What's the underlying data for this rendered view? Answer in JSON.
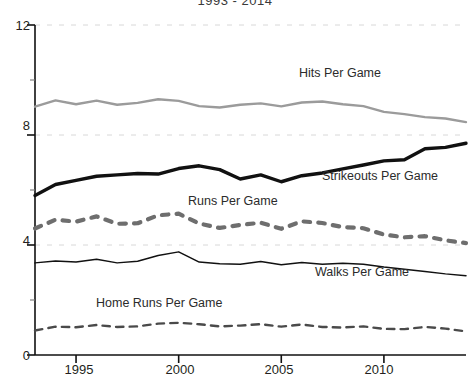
{
  "chart_data": {
    "type": "line",
    "title": "1993 - 2014",
    "xlabel": "",
    "ylabel": "",
    "xlim": [
      1993,
      2014
    ],
    "ylim": [
      0,
      12
    ],
    "yticks": [
      0,
      4,
      8,
      12
    ],
    "yticks_minor": [
      2,
      6,
      10
    ],
    "xticks": [
      1995,
      2000,
      2005,
      2010
    ],
    "xticks_minor": [
      1993,
      1994,
      1996,
      1997,
      1998,
      1999,
      2001,
      2002,
      2003,
      2004,
      2006,
      2007,
      2008,
      2009,
      2011,
      2012,
      2013,
      2014
    ],
    "grid": "horizontal-dotted-faint",
    "legend": "inline-annotations",
    "x": [
      1993,
      1994,
      1995,
      1996,
      1997,
      1998,
      1999,
      2000,
      2001,
      2002,
      2003,
      2004,
      2005,
      2006,
      2007,
      2008,
      2009,
      2010,
      2011,
      2012,
      2013,
      2014
    ],
    "series": [
      {
        "name": "Hits Per Game",
        "color": "#9b9b9b",
        "style": "solid",
        "width": 2.4,
        "values": [
          9.03,
          9.26,
          9.12,
          9.25,
          9.1,
          9.17,
          9.3,
          9.24,
          9.05,
          9.0,
          9.1,
          9.15,
          9.04,
          9.18,
          9.22,
          9.12,
          9.05,
          8.84,
          8.76,
          8.65,
          8.6,
          8.47
        ]
      },
      {
        "name": "Strikeouts Per Game",
        "color": "#111111",
        "style": "solid",
        "width": 3.4,
        "values": [
          5.8,
          6.2,
          6.35,
          6.5,
          6.55,
          6.6,
          6.58,
          6.78,
          6.88,
          6.74,
          6.4,
          6.55,
          6.3,
          6.52,
          6.62,
          6.77,
          6.91,
          7.06,
          7.1,
          7.5,
          7.55,
          7.7
        ]
      },
      {
        "name": "Runs Per Game",
        "color": "#6e6e6e",
        "style": "dashed-thick",
        "width": 4.2,
        "values": [
          4.6,
          4.92,
          4.85,
          5.04,
          4.77,
          4.79,
          5.08,
          5.14,
          4.78,
          4.62,
          4.73,
          4.81,
          4.59,
          4.86,
          4.8,
          4.65,
          4.61,
          4.38,
          4.28,
          4.32,
          4.17,
          4.07
        ]
      },
      {
        "name": "Walks Per Game",
        "color": "#111111",
        "style": "solid",
        "width": 1.5,
        "values": [
          3.35,
          3.42,
          3.38,
          3.48,
          3.35,
          3.41,
          3.62,
          3.75,
          3.38,
          3.32,
          3.3,
          3.4,
          3.28,
          3.36,
          3.3,
          3.34,
          3.3,
          3.2,
          3.12,
          3.04,
          2.95,
          2.88
        ]
      },
      {
        "name": "Home Runs Per Game",
        "color": "#4a4a4a",
        "style": "dashed-thin",
        "width": 2.4,
        "values": [
          0.89,
          1.03,
          1.01,
          1.09,
          1.02,
          1.04,
          1.14,
          1.17,
          1.12,
          1.04,
          1.07,
          1.12,
          1.03,
          1.11,
          1.02,
          1.0,
          1.04,
          0.95,
          0.94,
          1.02,
          0.96,
          0.86
        ]
      }
    ],
    "annotations": [
      {
        "text": "Hits Per Game",
        "x_px": 299,
        "y_px": 66
      },
      {
        "text": "Strikeouts Per Game",
        "x_px": 322,
        "y_px": 169
      },
      {
        "text": "Runs Per Game",
        "x_px": 188,
        "y_px": 194
      },
      {
        "text": "Walks Per Game",
        "x_px": 315,
        "y_px": 265
      },
      {
        "text": "Home Runs Per Game",
        "x_px": 96,
        "y_px": 296
      }
    ]
  },
  "axis": {
    "y_labels": [
      "12",
      "8",
      "4",
      "0"
    ],
    "x_labels": [
      "1995",
      "2000",
      "2005",
      "2010"
    ]
  }
}
